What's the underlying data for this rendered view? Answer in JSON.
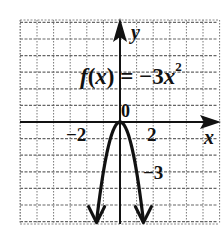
{
  "chart_data": {
    "type": "line",
    "function": "f(x) = -3x^2",
    "xlabel": "x",
    "ylabel": "y",
    "xlim": [
      -6,
      6
    ],
    "ylim": [
      -6.2,
      6.2
    ],
    "grid": true,
    "x_tick_labels": [
      "-2",
      "2"
    ],
    "y_tick_labels": [
      "-3"
    ],
    "origin_label": "0",
    "series": [
      {
        "name": "f(x) = -3x^2",
        "x": [
          -1.41,
          -1.2,
          -1.0,
          -0.8,
          -0.6,
          -0.4,
          -0.2,
          0,
          0.2,
          0.4,
          0.6,
          0.8,
          1.0,
          1.2,
          1.41
        ],
        "y": [
          -6.0,
          -4.32,
          -3.0,
          -1.92,
          -1.08,
          -0.48,
          -0.12,
          0,
          -0.12,
          -0.48,
          -1.08,
          -1.92,
          -3.0,
          -4.32,
          -6.0
        ]
      }
    ],
    "annotations": [
      "f(x) = -3x^2",
      "0",
      "-2",
      "2",
      "-3",
      "x",
      "y"
    ]
  },
  "labels": {
    "func_f": "f",
    "func_x": "(x)",
    "func_eq": " = −3",
    "func_var": "x",
    "func_exp": "2",
    "origin": "0",
    "tick_neg2": "−2",
    "tick_2": "2",
    "tick_neg3": "−3",
    "axis_x": "x",
    "axis_y": "y"
  }
}
